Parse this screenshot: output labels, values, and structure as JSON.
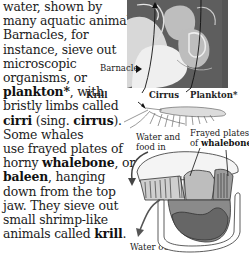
{
  "body_text": {
    "lines": [
      [
        {
          "t": "water, shown by",
          "b": false
        }
      ],
      [
        {
          "t": "many aquatic animals.",
          "b": false
        }
      ],
      [
        {
          "t": "Barnacles, for",
          "b": false
        }
      ],
      [
        {
          "t": "instance, sieve out",
          "b": false
        }
      ],
      [
        {
          "t": "microscopic",
          "b": false
        }
      ],
      [
        {
          "t": "organisms, or",
          "b": false
        }
      ],
      [
        {
          "t": "plankton*",
          "b": true
        },
        {
          "t": ", with",
          "b": false
        }
      ],
      [
        {
          "t": "bristly limbs called",
          "b": false
        }
      ],
      [
        {
          "t": "cirri",
          "b": true
        },
        {
          "t": " (sing. ",
          "b": false
        },
        {
          "t": "cirrus",
          "b": true
        },
        {
          "t": ").",
          "b": false
        }
      ],
      [
        {
          "t": "Some whales",
          "b": false
        }
      ],
      [
        {
          "t": "use frayed plates of",
          "b": false
        }
      ],
      [
        {
          "t": "horny ",
          "b": false
        },
        {
          "t": "whalebone",
          "b": true
        },
        {
          "t": ", or",
          "b": false
        }
      ],
      [
        {
          "t": "baleen",
          "b": true
        },
        {
          "t": ", hanging",
          "b": false
        }
      ],
      [
        {
          "t": "down from the top",
          "b": false
        }
      ],
      [
        {
          "t": "jaw. They sieve out",
          "b": false
        }
      ],
      [
        {
          "t": "small shrimp-like",
          "b": false
        }
      ],
      [
        {
          "t": "animals called ",
          "b": false
        },
        {
          "t": "krill",
          "b": true
        },
        {
          "t": ".",
          "b": false
        }
      ]
    ]
  },
  "barnacle_figure": {
    "labels": {
      "barnacle": "Barnacle",
      "krill": "Krill",
      "cirrus": "Cirrus",
      "plankton": "Plankton*"
    }
  },
  "whale_figure": {
    "labels": {
      "water_in_1": "Water and",
      "water_in_2": "food in",
      "plates_1": "Frayed plates",
      "plates_2_prefix": "of ",
      "plates_2_bold": "whalebone",
      "water_out": "Water out"
    }
  },
  "colors": {
    "photo_bg": "#6a6a6a",
    "text": "#222222"
  }
}
